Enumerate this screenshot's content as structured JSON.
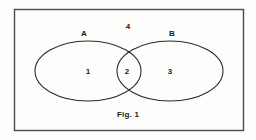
{
  "figure": {
    "caption": "Fig. 1",
    "border_color": "#4a4a4a",
    "background_color": "#fdfdfc",
    "stroke_color": "#2b2b2b",
    "text_color": "#1a1a1a",
    "frame": {
      "x": 14,
      "y": 9,
      "width": 229,
      "height": 121
    }
  },
  "sets": [
    {
      "name": "set-a",
      "label": "A",
      "label_x": 84,
      "label_y": 34,
      "cx": 88,
      "cy": 71,
      "rx": 53,
      "ry": 30
    },
    {
      "name": "set-b",
      "label": "B",
      "label_x": 172,
      "label_y": 34,
      "cx": 170,
      "cy": 71,
      "rx": 53,
      "ry": 30
    }
  ],
  "regions": [
    {
      "name": "region-a-only",
      "label": "1",
      "x": 88,
      "y": 72
    },
    {
      "name": "region-intersection",
      "label": "2",
      "x": 127,
      "y": 72
    },
    {
      "name": "region-b-only",
      "label": "3",
      "x": 170,
      "y": 72
    },
    {
      "name": "region-universe",
      "label": "4",
      "x": 128,
      "y": 27
    }
  ],
  "caption": {
    "text": "Fig. 1",
    "x": 128,
    "y": 115
  }
}
